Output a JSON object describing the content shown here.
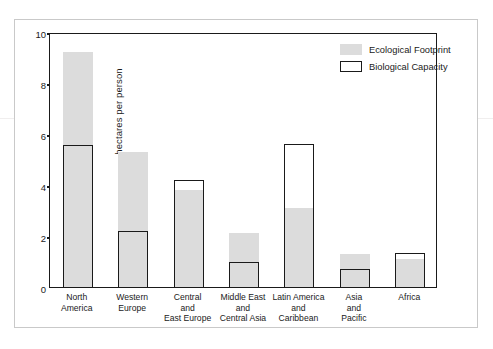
{
  "figure": {
    "frame_color": "#c9c9c9",
    "background": "#ffffff"
  },
  "legend": {
    "position": "top-right",
    "items": [
      {
        "label": "Ecological Footprint",
        "swatch": "filled-gray-swatch",
        "color": "#dcdcdc"
      },
      {
        "label": "Biological Capacity",
        "swatch": "outlined-white-swatch",
        "color": "#ffffff"
      }
    ]
  },
  "chart_data": {
    "type": "bar",
    "title": "",
    "subtitle": "",
    "xlabel": "",
    "ylabel": "hectares per person",
    "ylim": [
      0,
      10
    ],
    "yticks": [
      0,
      2,
      4,
      6,
      8,
      10
    ],
    "ytick_labels": [
      "0",
      "2",
      "4",
      "6",
      "8",
      "10"
    ],
    "grid": false,
    "overlap_style": "overlaid",
    "categories": [
      "North\nAmerica",
      "Western\nEurope",
      "Central\nand\nEast Europe",
      "Middle East\nand\nCentral Asia",
      "Latin America\nand\nCaribbean",
      "Asia\nand\nPacific",
      "Africa"
    ],
    "series": [
      {
        "name": "Ecological Footprint",
        "color": "#dcdcdc",
        "values": [
          9.2,
          5.3,
          3.8,
          2.1,
          3.1,
          1.3,
          1.1
        ]
      },
      {
        "name": "Biological Capacity",
        "color": "#ffffff",
        "values": [
          5.55,
          2.2,
          4.2,
          1.0,
          5.6,
          0.7,
          1.35
        ]
      }
    ]
  }
}
